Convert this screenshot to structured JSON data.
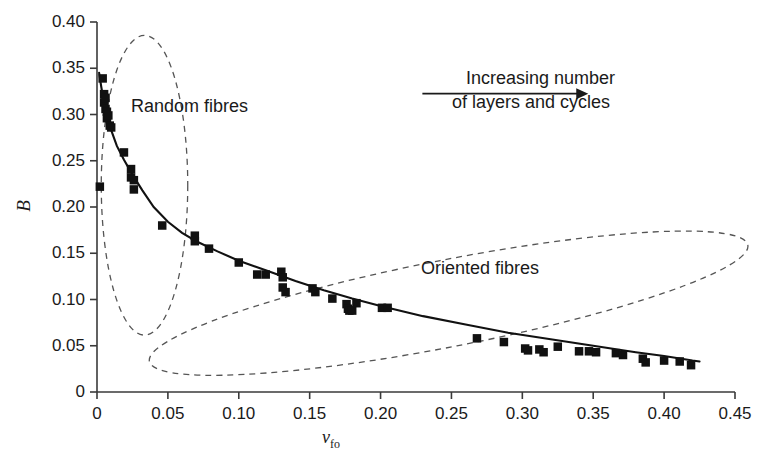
{
  "chart_data": {
    "type": "scatter",
    "title": "",
    "xlabel": "v_fo",
    "ylabel": "B",
    "xlim": [
      0,
      0.45
    ],
    "ylim": [
      0,
      0.4
    ],
    "grid": false,
    "legend_position": "none",
    "x_ticks": [
      0,
      0.05,
      0.1,
      0.15,
      0.2,
      0.25,
      0.3,
      0.35,
      0.4,
      0.45
    ],
    "x_tick_labels": [
      "0",
      "0.05",
      "0.10",
      "0.15",
      "0.20",
      "0.25",
      "0.30",
      "0.35",
      "0.40",
      "0.45"
    ],
    "y_ticks": [
      0,
      0.05,
      0.1,
      0.15,
      0.2,
      0.25,
      0.3,
      0.35,
      0.4
    ],
    "y_tick_labels": [
      "0",
      "0.05",
      "0.10",
      "0.15",
      "0.20",
      "0.25",
      "0.30",
      "0.35",
      "0.40"
    ],
    "series": [
      {
        "name": "measurements",
        "marker": "filled-square",
        "color": "#111111",
        "points": [
          [
            0.002,
            0.222
          ],
          [
            0.004,
            0.339
          ],
          [
            0.005,
            0.322
          ],
          [
            0.005,
            0.313
          ],
          [
            0.006,
            0.318
          ],
          [
            0.006,
            0.306
          ],
          [
            0.007,
            0.303
          ],
          [
            0.007,
            0.296
          ],
          [
            0.008,
            0.299
          ],
          [
            0.009,
            0.288
          ],
          [
            0.01,
            0.286
          ],
          [
            0.019,
            0.259
          ],
          [
            0.024,
            0.241
          ],
          [
            0.024,
            0.232
          ],
          [
            0.026,
            0.229
          ],
          [
            0.026,
            0.219
          ],
          [
            0.046,
            0.18
          ],
          [
            0.069,
            0.169
          ],
          [
            0.069,
            0.163
          ],
          [
            0.079,
            0.155
          ],
          [
            0.1,
            0.14
          ],
          [
            0.113,
            0.127
          ],
          [
            0.119,
            0.127
          ],
          [
            0.13,
            0.13
          ],
          [
            0.131,
            0.124
          ],
          [
            0.131,
            0.113
          ],
          [
            0.133,
            0.108
          ],
          [
            0.152,
            0.112
          ],
          [
            0.154,
            0.108
          ],
          [
            0.166,
            0.101
          ],
          [
            0.176,
            0.095
          ],
          [
            0.177,
            0.09
          ],
          [
            0.178,
            0.088
          ],
          [
            0.18,
            0.088
          ],
          [
            0.183,
            0.096
          ],
          [
            0.201,
            0.091
          ],
          [
            0.205,
            0.091
          ],
          [
            0.268,
            0.058
          ],
          [
            0.287,
            0.054
          ],
          [
            0.302,
            0.047
          ],
          [
            0.304,
            0.045
          ],
          [
            0.312,
            0.046
          ],
          [
            0.315,
            0.043
          ],
          [
            0.325,
            0.049
          ],
          [
            0.34,
            0.044
          ],
          [
            0.347,
            0.044
          ],
          [
            0.352,
            0.043
          ],
          [
            0.366,
            0.042
          ],
          [
            0.371,
            0.04
          ],
          [
            0.385,
            0.036
          ],
          [
            0.387,
            0.032
          ],
          [
            0.4,
            0.034
          ],
          [
            0.411,
            0.033
          ],
          [
            0.419,
            0.029
          ]
        ]
      }
    ],
    "fit_curve": {
      "name": "fitted-decay-curve",
      "style": "solid",
      "color": "#111111",
      "points": [
        [
          0.0015,
          0.345
        ],
        [
          0.003,
          0.33
        ],
        [
          0.005,
          0.312
        ],
        [
          0.007,
          0.298
        ],
        [
          0.01,
          0.283
        ],
        [
          0.014,
          0.266
        ],
        [
          0.019,
          0.251
        ],
        [
          0.025,
          0.235
        ],
        [
          0.032,
          0.218
        ],
        [
          0.04,
          0.2
        ],
        [
          0.05,
          0.184
        ],
        [
          0.06,
          0.172
        ],
        [
          0.07,
          0.163
        ],
        [
          0.085,
          0.152
        ],
        [
          0.1,
          0.142
        ],
        [
          0.12,
          0.131
        ],
        [
          0.14,
          0.12
        ],
        [
          0.16,
          0.11
        ],
        [
          0.18,
          0.101
        ],
        [
          0.2,
          0.093
        ],
        [
          0.23,
          0.082
        ],
        [
          0.26,
          0.073
        ],
        [
          0.29,
          0.064
        ],
        [
          0.32,
          0.057
        ],
        [
          0.35,
          0.05
        ],
        [
          0.38,
          0.043
        ],
        [
          0.4,
          0.039
        ],
        [
          0.42,
          0.034
        ],
        [
          0.425,
          0.033
        ]
      ]
    },
    "annotations": [
      {
        "name": "random-fibres-label",
        "text": "Random fibres",
        "ellipse": {
          "cx": 0.0335,
          "cy": 0.2235,
          "rx": 0.0305,
          "ry": 0.162,
          "rotation": 0,
          "style": "dashed"
        }
      },
      {
        "name": "oriented-fibres-label",
        "text": "Oriented fibres",
        "ellipse": {
          "cx": 0.248,
          "cy": 0.096,
          "rx": 0.215,
          "ry": 0.047,
          "rotation": -11,
          "style": "dashed"
        }
      },
      {
        "name": "increasing-trend-arrow",
        "line1": "Increasing number",
        "line2": "of layers and cycles",
        "arrow": {
          "x_start": 0.2295,
          "x_end": 0.3465,
          "y": 0.3225,
          "direction": "right"
        }
      }
    ]
  },
  "colors": {
    "axis": "#3a3a3a",
    "marker": "#111111",
    "curve": "#111111",
    "dashed": "#555555",
    "text": "#1a1a1a",
    "background": "#ffffff"
  }
}
